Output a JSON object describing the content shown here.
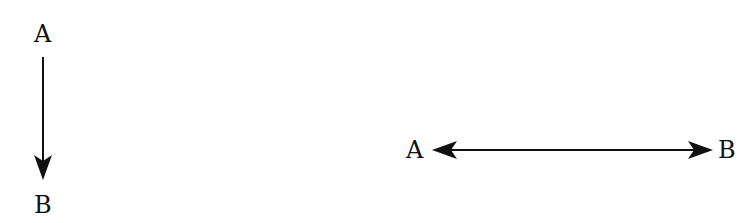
{
  "diagrams": [
    {
      "id": "unidirectional",
      "orientation": "vertical",
      "source": {
        "label": "A"
      },
      "target": {
        "label": "B"
      },
      "arrow": "one-way (A → B)"
    },
    {
      "id": "bidirectional",
      "orientation": "horizontal",
      "source": {
        "label": "A"
      },
      "target": {
        "label": "B"
      },
      "arrow": "two-way (A ↔ B)"
    }
  ],
  "colors": {
    "stroke": "#111111",
    "background": "#ffffff"
  }
}
